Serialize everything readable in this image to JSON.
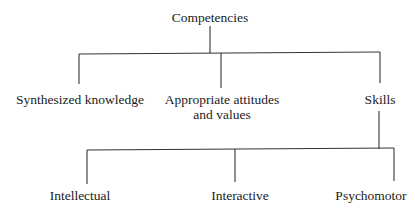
{
  "diagram": {
    "type": "tree",
    "root": {
      "label": "Competencies"
    },
    "level1": [
      {
        "label": "Synthesized knowledge"
      },
      {
        "label_line1": "Appropriate attitudes",
        "label_line2": "and values"
      },
      {
        "label": "Skills"
      }
    ],
    "level2_parent": "Skills",
    "level2": [
      {
        "label": "Intellectual"
      },
      {
        "label": "Interactive"
      },
      {
        "label": "Psychomotor"
      }
    ],
    "colors": {
      "line": "#333333",
      "text": "#222222",
      "background": "#ffffff"
    }
  }
}
